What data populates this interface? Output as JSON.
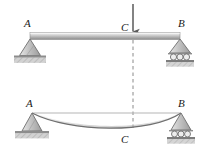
{
  "figure": {
    "type": "structural-beam-deflection-diagram",
    "colors": {
      "beam_light": "#f2f2f2",
      "beam_mid": "#c9c9c9",
      "beam_dark": "#8f8f8f",
      "support_fill": "#c4c4c4",
      "support_stroke": "#6e6e6e",
      "ground_fill": "#b0b0b0",
      "line": "#555555",
      "label": "#1a1a1a",
      "arrow": "#4a4a4a",
      "dashed": "#7a7a7a"
    },
    "upper_diagram": {
      "name": "loaded-beam",
      "labels": {
        "left_support": "A",
        "load_point": "C",
        "right_support": "B"
      },
      "beam": {
        "x1": 30,
        "x2": 180,
        "y": 33,
        "thickness": 7
      },
      "load_arrow": {
        "x": 133,
        "y_start": 3,
        "y_end": 33,
        "direction": "down"
      },
      "supports": {
        "left": {
          "type": "pin",
          "x": 30,
          "y": 40
        },
        "right": {
          "type": "roller",
          "x": 180,
          "y": 40,
          "roller_count": 3
        }
      }
    },
    "lower_diagram": {
      "name": "deflected-beam",
      "labels": {
        "left_support": "A",
        "deflection_point": "C",
        "right_support": "B"
      },
      "reference_line": {
        "x1": 32,
        "x2": 181,
        "y": 113
      },
      "deflection_curve": {
        "start_x": 32,
        "end_x": 181,
        "y": 113,
        "min_x": 112,
        "min_y": 129
      },
      "supports": {
        "left": {
          "type": "pin",
          "x": 32,
          "y": 113
        },
        "right": {
          "type": "roller",
          "x": 181,
          "y": 113,
          "roller_count": 3
        }
      }
    },
    "dashed_line": {
      "x": 133,
      "y_start": 40,
      "y_end": 128
    }
  }
}
